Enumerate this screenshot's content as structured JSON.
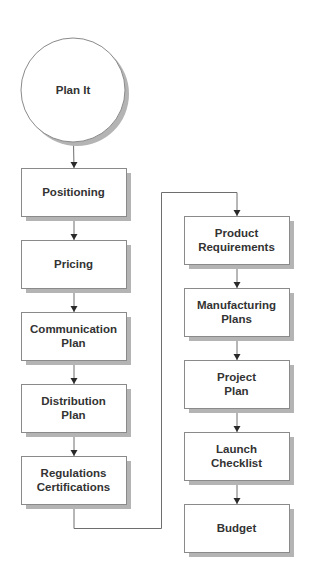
{
  "diagram": {
    "type": "flowchart",
    "start": {
      "id": "plan-it",
      "label": [
        "Plan It"
      ],
      "shape": "circle"
    },
    "left_column": [
      {
        "id": "positioning",
        "label": [
          "Positioning"
        ]
      },
      {
        "id": "pricing",
        "label": [
          "Pricing"
        ]
      },
      {
        "id": "communication-plan",
        "label": [
          "Communication",
          "Plan"
        ]
      },
      {
        "id": "distribution-plan",
        "label": [
          "Distribution",
          "Plan"
        ]
      },
      {
        "id": "regulations-certifications",
        "label": [
          "Regulations",
          "Certifications"
        ]
      }
    ],
    "right_column": [
      {
        "id": "product-requirements",
        "label": [
          "Product",
          "Requirements"
        ]
      },
      {
        "id": "manufacturing-plans",
        "label": [
          "Manufacturing",
          "Plans"
        ]
      },
      {
        "id": "project-plan",
        "label": [
          "Project",
          "Plan"
        ]
      },
      {
        "id": "launch-checklist",
        "label": [
          "Launch",
          "Checklist"
        ]
      },
      {
        "id": "budget",
        "label": [
          "Budget"
        ]
      }
    ],
    "edges": [
      [
        "plan-it",
        "positioning"
      ],
      [
        "positioning",
        "pricing"
      ],
      [
        "pricing",
        "communication-plan"
      ],
      [
        "communication-plan",
        "distribution-plan"
      ],
      [
        "distribution-plan",
        "regulations-certifications"
      ],
      [
        "regulations-certifications",
        "product-requirements"
      ],
      [
        "product-requirements",
        "manufacturing-plans"
      ],
      [
        "manufacturing-plans",
        "project-plan"
      ],
      [
        "project-plan",
        "launch-checklist"
      ],
      [
        "launch-checklist",
        "budget"
      ]
    ],
    "colors": {
      "node_fill": "#ffffff",
      "node_stroke": "#8a8a8a",
      "shadow": "#b4b4b4",
      "line": "#6e6e6e",
      "arrow": "#2a2a2a",
      "text": "#333333"
    }
  }
}
